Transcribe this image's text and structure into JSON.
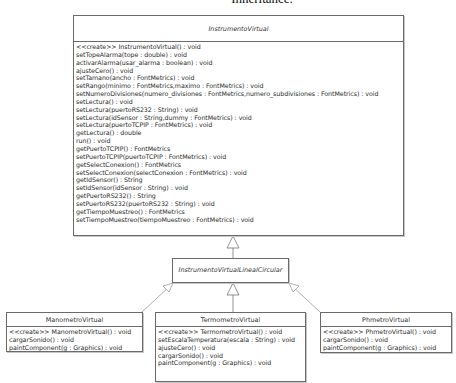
{
  "caption": "Inheritance.",
  "classes": {
    "instrumento_virtual": {
      "name": "InstrumentoVirtual",
      "abstract": true,
      "methods": [
        "<<create>> InstrumentoVirtual() : void",
        "setTopeAlarma(tope : double) : void",
        "activarAlarma(usar_alarma : boolean) : void",
        "ajusteCero() : void",
        "setTamano(ancho : FontMetrics) : void",
        "setRango(minimo : FontMetrics,maximo : FontMetrics) : void",
        "setNumeroDivisiones(numero_divisiones : FontMetrics,numero_subdivisiones : FontMetrics) : void",
        "setLectura() : void",
        "setLectura(puertoRS232 : String) : void",
        "setLectura(idSensor : String,dummy : FontMetrics) : void",
        "setLectura(puertoTCPIP : FontMetrics) : void",
        "getLectura() : double",
        "run() : void",
        "getPuertoTCPIP() : FontMetrics",
        "setPuertoTCPIP(puertoTCPIP : FontMetrics) : void",
        "getSelectConexion() : FontMetrics",
        "setSelectConexion(selectConexion : FontMetrics) : void",
        "getIdSensor() : String",
        "setIdSensor(idSensor : String) : void",
        "getPuertoRS232() : String",
        "setPuertoRS232(puertoRS232 : String) : void",
        "getTiempoMuestreo() : FontMetrics",
        "setTiempoMuestreo(tiempoMuestreo : FontMetrics) : void"
      ]
    },
    "lineal_circular": {
      "name": "InstrumentoVirtualLinealCircular",
      "abstract": true
    },
    "manometro": {
      "name": "ManometroVirtual",
      "methods": [
        "<<create>> ManometroVirtual() : void",
        "cargarSonido() : void",
        "paintComponent(g : Graphics) : void"
      ]
    },
    "termometro": {
      "name": "TermometroVirtual",
      "methods": [
        "<<create>> TermometroVirtual() : void",
        "setEscalaTemperatura(escala : String) : void",
        "ajusteCero() : void",
        "cargarSonido() : void",
        "paintComponent(g : Graphics) : void"
      ]
    },
    "phmetro": {
      "name": "PhmetroVirtual",
      "methods": [
        "<<create>> PhmetroVirtual() : void",
        "cargarSonido() : void",
        "paintComponent(g : Graphics) : void"
      ]
    }
  },
  "relations": [
    {
      "from": "InstrumentoVirtualLinealCircular",
      "to": "InstrumentoVirtual",
      "type": "generalization",
      "style": "solid"
    },
    {
      "from": "TermometroVirtual",
      "to": "InstrumentoVirtualLinealCircular",
      "type": "generalization",
      "style": "solid"
    },
    {
      "from": "ManometroVirtual",
      "to": "InstrumentoVirtualLinealCircular",
      "type": "generalization",
      "style": "solid"
    },
    {
      "from": "PhmetroVirtual",
      "to": "InstrumentoVirtualLinealCircular",
      "type": "generalization",
      "style": "solid"
    }
  ],
  "colors": {
    "border": "#6a6a6a",
    "text": "#2a2a2a",
    "line": "#8a8a8a",
    "background": "#ffffff"
  }
}
